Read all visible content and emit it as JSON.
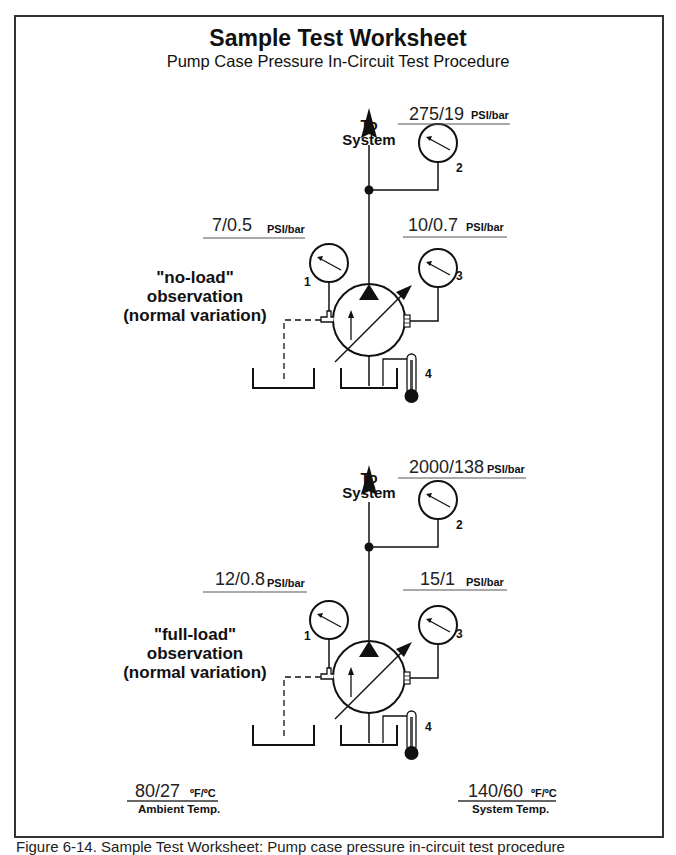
{
  "header": {
    "title": "Sample Test Worksheet",
    "subtitle": "Pump Case Pressure In-Circuit Test Procedure"
  },
  "diagrams": [
    {
      "id": "no-load",
      "observation": [
        "\"no-load\"",
        "observation",
        "(normal variation)"
      ],
      "to_system": [
        "To",
        "System"
      ],
      "gauges": [
        {
          "number": "1",
          "value": "7/0.5",
          "unit": "PSI/bar"
        },
        {
          "number": "2",
          "value": "275/19",
          "unit": "PSI/bar"
        },
        {
          "number": "3",
          "value": "10/0.7",
          "unit": "PSI/bar"
        },
        {
          "number": "4",
          "type": "thermometer"
        }
      ]
    },
    {
      "id": "full-load",
      "observation": [
        "\"full-load\"",
        "observation",
        "(normal variation)"
      ],
      "to_system": [
        "To",
        "System"
      ],
      "gauges": [
        {
          "number": "1",
          "value": "12/0.8",
          "unit": "PSI/bar"
        },
        {
          "number": "2",
          "value": "2000/138",
          "unit": "PSI/bar"
        },
        {
          "number": "3",
          "value": "15/1",
          "unit": "PSI/bar"
        },
        {
          "number": "4",
          "type": "thermometer"
        }
      ]
    }
  ],
  "temperatures": {
    "ambient": {
      "value": "80/27",
      "unit": "ºF/ºC",
      "label": "Ambient Temp."
    },
    "system": {
      "value": "140/60",
      "unit": "ºF/ºC",
      "label": "System Temp."
    }
  },
  "caption": "Figure 6-14. Sample Test Worksheet: Pump case pressure in-circuit test procedure"
}
